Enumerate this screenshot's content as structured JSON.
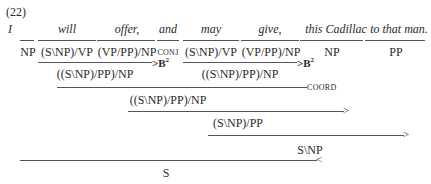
{
  "example_number": "(22)",
  "words": [
    "I",
    "will",
    "offer,",
    "and",
    "may",
    "give,",
    "this Cadillac",
    "to that man."
  ],
  "lexical_categories": [
    "NP",
    "(S\\NP)/VP",
    "(VP/PP)/NP",
    "CONJ",
    "(S\\NP)/VP",
    "(VP/PP)/NP",
    "NP",
    "PP"
  ],
  "derivation": {
    "step1_left": {
      "result": "((S\\NP)/PP)/NP",
      "rule": ">B",
      "rule_sup": "2"
    },
    "step1_right": {
      "result": "((S\\NP)/PP)/NP",
      "rule": ">B",
      "rule_sup": "2"
    },
    "step2": {
      "result": "((S\\NP)/PP)/NP",
      "rule": "COORD"
    },
    "step3": {
      "result": "(S\\NP)/PP",
      "rule": ">"
    },
    "step4": {
      "result": "S\\NP",
      "rule": ">"
    },
    "step5": {
      "result": "S",
      "rule": "<"
    }
  }
}
